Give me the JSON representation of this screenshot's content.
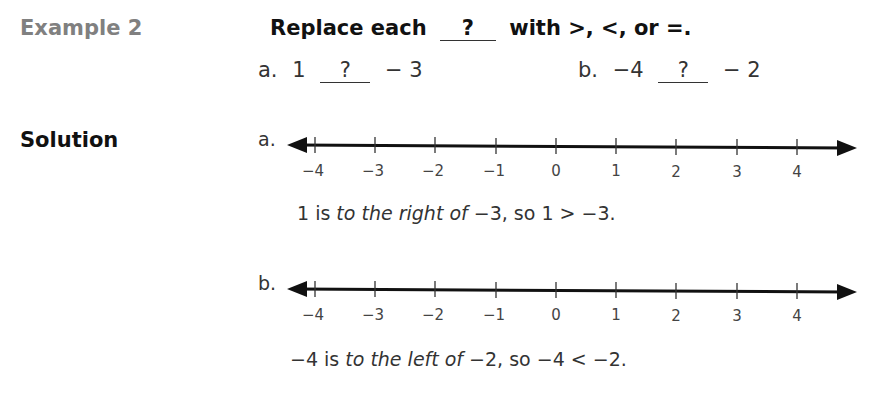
{
  "example": {
    "label": "Example 2",
    "instruction": {
      "prefix": "Replace each",
      "blank": "?",
      "suffix": "with >, <, or =."
    },
    "problems": [
      {
        "label": "a.",
        "left": "1",
        "blank": "?",
        "right": "− 3"
      },
      {
        "label": "b.",
        "left": "−4",
        "blank": "?",
        "right": "− 2"
      }
    ]
  },
  "solution": {
    "label": "Solution",
    "parts": [
      {
        "label": "a.",
        "explanation": {
          "start": "1 is ",
          "italic1": "to the right of",
          "mid": " −3, so 1 > −3."
        }
      },
      {
        "label": "b.",
        "explanation": {
          "start": "−4 is ",
          "italic1": "to the left of",
          "mid": " −2, so −4 < −2."
        }
      }
    ]
  },
  "number_line": {
    "ticks": [
      "−4",
      "−3",
      "−2",
      "−1",
      "0",
      "1",
      "2",
      "3",
      "4"
    ],
    "min": -4,
    "max": 4,
    "arrows": "both"
  }
}
